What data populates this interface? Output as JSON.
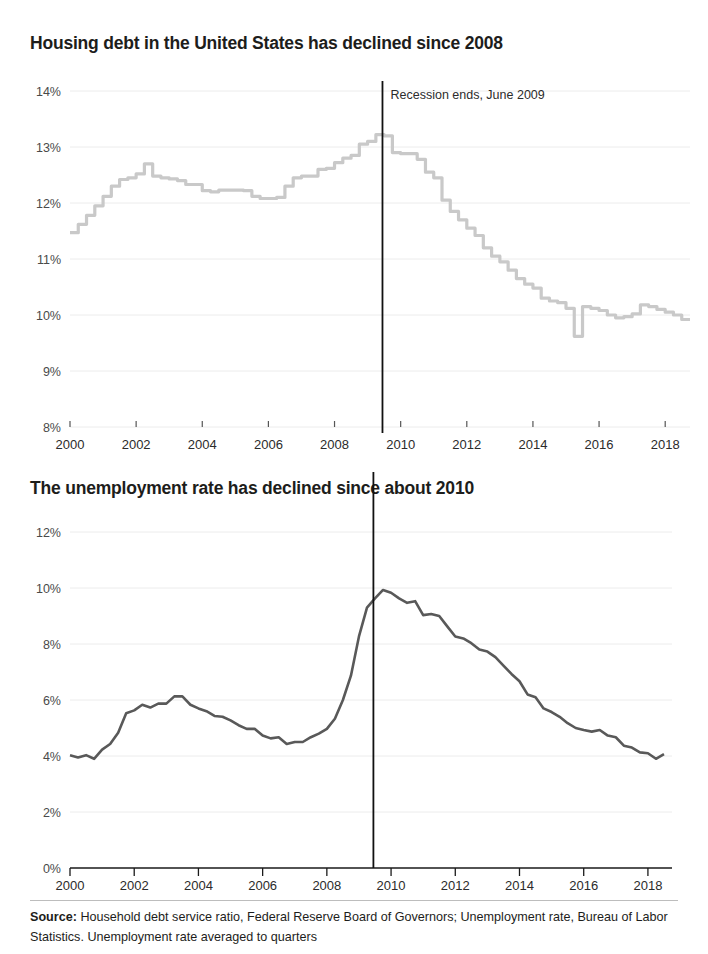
{
  "charts": [
    {
      "title": "Housing debt in the United States has declined since 2008",
      "annotation": "Recession ends, June 2009",
      "line_color": "#c9c9c9"
    },
    {
      "title": "The unemployment rate has declined since about 2010",
      "line_color": "#595959"
    }
  ],
  "source": {
    "label": "Source:",
    "text": " Household debt service ratio, Federal Reserve Board of Governors; Unemployment rate, Bureau of Labor Statistics. Unemployment rate averaged to quarters"
  },
  "chart_data": [
    {
      "type": "line",
      "title": "Housing debt in the United States has declined since 2008",
      "xlabel": "",
      "ylabel": "",
      "xlim": [
        2000.0,
        2018.75
      ],
      "ylim": [
        8,
        14
      ],
      "ytick_labels": [
        "8%",
        "9%",
        "10%",
        "11%",
        "12%",
        "13%",
        "14%"
      ],
      "yticks": [
        8,
        9,
        10,
        11,
        12,
        13,
        14
      ],
      "xtick_labels": [
        "2000",
        "2002",
        "2004",
        "2006",
        "2008",
        "2010",
        "2012",
        "2014",
        "2016",
        "2018"
      ],
      "xticks": [
        2000,
        2002,
        2004,
        2006,
        2008,
        2010,
        2012,
        2014,
        2016,
        2018
      ],
      "grid": true,
      "legend": "none",
      "series_name": "Household debt service ratio",
      "color": "#c9c9c9",
      "annotations": [
        {
          "text": "Recession ends, June 2009",
          "x": 2009.45,
          "type": "vertical-line"
        }
      ],
      "x": [
        2000.0,
        2000.25,
        2000.5,
        2000.75,
        2001.0,
        2001.25,
        2001.5,
        2001.75,
        2002.0,
        2002.25,
        2002.5,
        2002.75,
        2003.0,
        2003.25,
        2003.5,
        2003.75,
        2004.0,
        2004.25,
        2004.5,
        2004.75,
        2005.0,
        2005.25,
        2005.5,
        2005.75,
        2006.0,
        2006.25,
        2006.5,
        2006.75,
        2007.0,
        2007.25,
        2007.5,
        2007.75,
        2008.0,
        2008.25,
        2008.5,
        2008.75,
        2009.0,
        2009.25,
        2009.5,
        2009.75,
        2010.0,
        2010.25,
        2010.5,
        2010.75,
        2011.0,
        2011.25,
        2011.5,
        2011.75,
        2012.0,
        2012.25,
        2012.5,
        2012.75,
        2013.0,
        2013.25,
        2013.5,
        2013.75,
        2014.0,
        2014.25,
        2014.5,
        2014.75,
        2015.0,
        2015.25,
        2015.5,
        2015.75,
        2016.0,
        2016.25,
        2016.5,
        2016.75,
        2017.0,
        2017.25,
        2017.5,
        2017.75,
        2018.0,
        2018.25,
        2018.5
      ],
      "values": [
        11.47,
        11.62,
        11.78,
        11.95,
        12.12,
        12.3,
        12.42,
        12.45,
        12.52,
        12.7,
        12.48,
        12.45,
        12.43,
        12.4,
        12.33,
        12.33,
        12.22,
        12.2,
        12.23,
        12.23,
        12.23,
        12.22,
        12.12,
        12.08,
        12.08,
        12.1,
        12.3,
        12.45,
        12.48,
        12.48,
        12.6,
        12.62,
        12.72,
        12.8,
        12.85,
        13.05,
        13.1,
        13.22,
        13.2,
        12.9,
        12.88,
        12.88,
        12.78,
        12.55,
        12.45,
        12.05,
        11.85,
        11.7,
        11.55,
        11.42,
        11.2,
        11.05,
        10.95,
        10.8,
        10.65,
        10.55,
        10.48,
        10.3,
        10.25,
        10.22,
        10.12,
        9.62,
        10.15,
        10.12,
        10.08,
        10.0,
        9.95,
        9.97,
        10.02,
        10.18,
        10.15,
        10.1,
        10.05,
        10.0,
        9.92
      ]
    },
    {
      "type": "line",
      "title": "The unemployment rate has declined since about 2010",
      "xlabel": "",
      "ylabel": "",
      "xlim": [
        2000.0,
        2018.75
      ],
      "ylim": [
        0,
        12
      ],
      "ytick_labels": [
        "0%",
        "2%",
        "4%",
        "6%",
        "8%",
        "10%",
        "12%"
      ],
      "yticks": [
        0,
        2,
        4,
        6,
        8,
        10,
        12
      ],
      "xtick_labels": [
        "2000",
        "2002",
        "2004",
        "2006",
        "2008",
        "2010",
        "2012",
        "2014",
        "2016",
        "2018"
      ],
      "xticks": [
        2000,
        2002,
        2004,
        2006,
        2008,
        2010,
        2012,
        2014,
        2016,
        2018
      ],
      "grid": true,
      "legend": "none",
      "series_name": "Unemployment rate",
      "color": "#595959",
      "annotations": [
        {
          "text": "Recession ends, June 2009",
          "x": 2009.45,
          "type": "vertical-line"
        }
      ],
      "x": [
        2000.0,
        2000.25,
        2000.5,
        2000.75,
        2001.0,
        2001.25,
        2001.5,
        2001.75,
        2002.0,
        2002.25,
        2002.5,
        2002.75,
        2003.0,
        2003.25,
        2003.5,
        2003.75,
        2004.0,
        2004.25,
        2004.5,
        2004.75,
        2005.0,
        2005.25,
        2005.5,
        2005.75,
        2006.0,
        2006.25,
        2006.5,
        2006.75,
        2007.0,
        2007.25,
        2007.5,
        2007.75,
        2008.0,
        2008.25,
        2008.5,
        2008.75,
        2009.0,
        2009.25,
        2009.5,
        2009.75,
        2010.0,
        2010.25,
        2010.5,
        2010.75,
        2011.0,
        2011.25,
        2011.5,
        2011.75,
        2012.0,
        2012.25,
        2012.5,
        2012.75,
        2013.0,
        2013.25,
        2013.5,
        2013.75,
        2014.0,
        2014.25,
        2014.5,
        2014.75,
        2015.0,
        2015.25,
        2015.5,
        2015.75,
        2016.0,
        2016.25,
        2016.5,
        2016.75,
        2017.0,
        2017.25,
        2017.5,
        2017.75,
        2018.0,
        2018.25,
        2018.5
      ],
      "values": [
        4.03,
        3.95,
        4.03,
        3.9,
        4.23,
        4.43,
        4.83,
        5.53,
        5.63,
        5.83,
        5.73,
        5.87,
        5.87,
        6.13,
        6.13,
        5.83,
        5.7,
        5.6,
        5.43,
        5.4,
        5.27,
        5.1,
        4.97,
        4.97,
        4.73,
        4.63,
        4.67,
        4.43,
        4.5,
        4.5,
        4.67,
        4.8,
        4.97,
        5.33,
        6.0,
        6.87,
        8.27,
        9.3,
        9.63,
        9.93,
        9.83,
        9.63,
        9.47,
        9.53,
        9.03,
        9.07,
        9.0,
        8.63,
        8.27,
        8.2,
        8.03,
        7.8,
        7.73,
        7.53,
        7.23,
        6.93,
        6.67,
        6.2,
        6.1,
        5.7,
        5.57,
        5.4,
        5.17,
        5.0,
        4.93,
        4.87,
        4.93,
        4.73,
        4.67,
        4.37,
        4.3,
        4.13,
        4.1,
        3.9,
        4.07
      ]
    }
  ]
}
